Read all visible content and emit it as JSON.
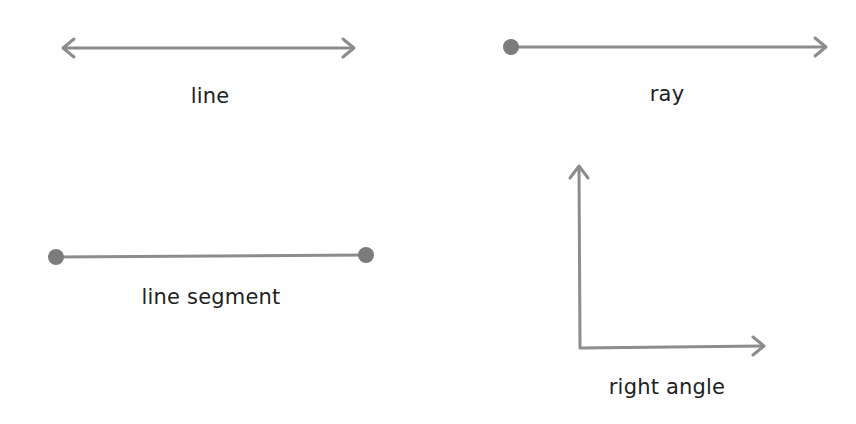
{
  "diagram": {
    "stroke_color": "#8c8c8c",
    "point_color": "#7c7c7c",
    "text_color": "#222222",
    "figures": [
      {
        "id": "line",
        "label": "line",
        "type": "line",
        "description": "Straight line with arrowheads at both ends"
      },
      {
        "id": "ray",
        "label": "ray",
        "type": "ray",
        "description": "Endpoint at left, arrowhead at right"
      },
      {
        "id": "line-segment",
        "label": "line segment",
        "type": "segment",
        "description": "Endpoints at both ends"
      },
      {
        "id": "right-angle",
        "label": "right angle",
        "type": "angle",
        "description": "Two perpendicular rays sharing a vertex, one pointing up and one pointing right"
      }
    ]
  }
}
